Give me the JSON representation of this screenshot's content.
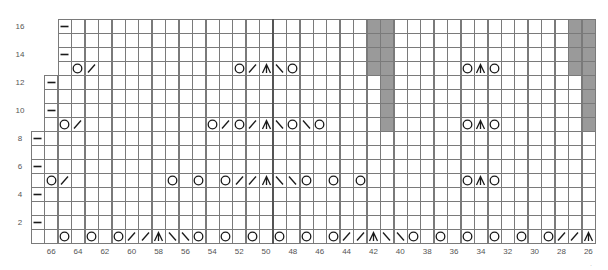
{
  "chart_data": {
    "type": "knitting-chart",
    "title": "",
    "rows": 16,
    "stitch_range": [
      67,
      26
    ],
    "row_labels": [
      "2",
      "4",
      "6",
      "8",
      "10",
      "12",
      "14",
      "16"
    ],
    "stitch_labels": [
      "66",
      "64",
      "62",
      "60",
      "58",
      "56",
      "54",
      "52",
      "50",
      "48",
      "46",
      "44",
      "42",
      "40",
      "38",
      "36",
      "34",
      "32",
      "30",
      "28",
      "26"
    ],
    "row_start_stitch": {
      "1": 67,
      "2": 67,
      "3": 67,
      "4": 67,
      "5": 67,
      "6": 67,
      "7": 67,
      "8": 67,
      "9": 66,
      "10": 66,
      "11": 66,
      "12": 66,
      "13": 65,
      "14": 65,
      "15": 65,
      "16": 65
    },
    "center_line_between_stitches": [
      50,
      49
    ],
    "legend_symbols": {
      "yo": "O",
      "k2tog": "/",
      "ssk": "\\",
      "cdd": "∧",
      "purl": "—"
    },
    "shaded_cells": [
      {
        "stitch": 42,
        "rows": [
          13,
          14,
          15,
          16
        ]
      },
      {
        "stitch": 41,
        "rows": [
          9,
          10,
          11,
          12,
          13,
          14,
          15,
          16
        ]
      },
      {
        "stitch": 27,
        "rows": [
          13,
          14,
          15,
          16
        ]
      },
      {
        "stitch": 26,
        "rows": [
          9,
          10,
          11,
          12,
          13,
          14,
          15,
          16
        ]
      }
    ],
    "symbols": {
      "1": {
        "65": "yo",
        "63": "yo",
        "61": "yo",
        "60": "k2tog",
        "59": "k2tog",
        "58": "cdd",
        "57": "ssk",
        "56": "ssk",
        "55": "yo",
        "53": "yo",
        "51": "yo",
        "49": "yo",
        "47": "yo",
        "45": "yo",
        "44": "k2tog",
        "43": "k2tog",
        "42": "cdd",
        "41": "ssk",
        "40": "ssk",
        "39": "yo",
        "37": "yo",
        "35": "yo",
        "33": "yo",
        "31": "yo",
        "29": "yo",
        "28": "k2tog",
        "27": "k2tog",
        "26": "cdd"
      },
      "2": {
        "67": "purl"
      },
      "4": {
        "67": "purl"
      },
      "5": {
        "66": "yo",
        "65": "k2tog",
        "57": "yo",
        "55": "yo",
        "53": "yo",
        "52": "k2tog",
        "51": "k2tog",
        "50": "cdd",
        "49": "ssk",
        "48": "ssk",
        "47": "yo",
        "45": "yo",
        "43": "yo",
        "35": "yo",
        "34": "cdd",
        "33": "yo"
      },
      "6": {
        "67": "purl"
      },
      "8": {
        "67": "purl"
      },
      "9": {
        "65": "yo",
        "64": "k2tog",
        "54": "yo",
        "53": "k2tog",
        "52": "yo",
        "51": "k2tog",
        "50": "cdd",
        "49": "ssk",
        "48": "yo",
        "47": "ssk",
        "46": "yo",
        "35": "yo",
        "34": "cdd",
        "33": "yo"
      },
      "10": {
        "66": "purl"
      },
      "12": {
        "66": "purl"
      },
      "13": {
        "64": "yo",
        "63": "k2tog",
        "52": "yo",
        "51": "k2tog",
        "50": "cdd",
        "49": "ssk",
        "48": "yo",
        "35": "yo",
        "34": "cdd",
        "33": "yo"
      },
      "14": {
        "65": "purl"
      },
      "16": {
        "65": "purl"
      }
    },
    "colors": {
      "grid": "#7a7a7a",
      "shade": "#9a9a9a",
      "symbol": "#1a1a1a",
      "label": "#555555"
    }
  },
  "corner_mark": "·"
}
